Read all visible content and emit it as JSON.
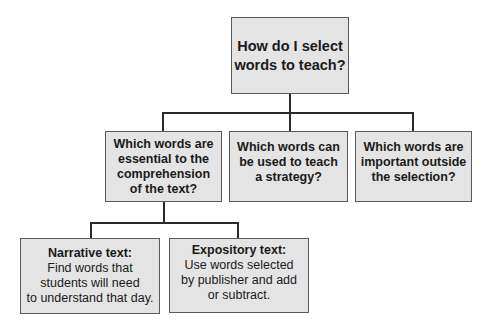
{
  "diagram": {
    "root": {
      "text": "How do I select\nwords to teach?"
    },
    "level2": [
      {
        "text": "Which words are\nessential to the\ncomprehension\nof the text?"
      },
      {
        "text": "Which words can\nbe used to teach\na strategy?"
      },
      {
        "text": "Which words are\nimportant outside\nthe selection?"
      }
    ],
    "level3": [
      {
        "title": "Narrative text:",
        "body": "Find words that\nstudents will need\nto understand that day."
      },
      {
        "title": "Expository text:",
        "body": "Use words selected\nby publisher and add\nor subtract."
      }
    ],
    "colors": {
      "box_fill": "#e4e4e4",
      "box_border": "#5a5a5a",
      "connector": "#2a2a2a"
    }
  }
}
